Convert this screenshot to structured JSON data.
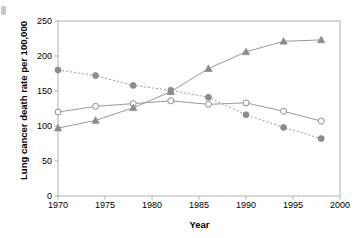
{
  "chart_data": {
    "type": "line",
    "title": "",
    "xlabel": "Year",
    "ylabel": "Lung cancer death rate per 100,000",
    "xlim": [
      1970,
      2000
    ],
    "ylim": [
      0,
      250
    ],
    "xticks": [
      1970,
      1975,
      1980,
      1985,
      1990,
      1995,
      2000
    ],
    "yticks": [
      0,
      50,
      100,
      150,
      200,
      250
    ],
    "grid": false,
    "legend": "none",
    "x": [
      1970,
      1974,
      1978,
      1982,
      1986,
      1990,
      1994,
      1998
    ],
    "series": [
      {
        "name": "series-filled-circle-dashed",
        "marker": "filled-circle",
        "line_style": "dashed",
        "color": "#8c8c8c",
        "values": [
          180,
          172,
          158,
          151,
          141,
          116,
          98,
          82
        ]
      },
      {
        "name": "series-open-circle-solid",
        "marker": "open-circle",
        "line_style": "solid",
        "color": "#8c8c8c",
        "values": [
          120,
          128,
          132,
          136,
          131,
          133,
          121,
          107
        ]
      },
      {
        "name": "series-filled-triangle-solid",
        "marker": "filled-triangle",
        "line_style": "solid",
        "color": "#8c8c8c",
        "values": [
          97,
          108,
          126,
          149,
          182,
          206,
          221,
          223
        ]
      }
    ]
  },
  "axes": {
    "y_title": "Lung cancer death rate per 100,000",
    "x_title": "Year",
    "y_tick_labels": [
      "250",
      "200",
      "150",
      "100",
      "50",
      "0"
    ],
    "x_tick_labels": [
      "1970",
      "1975",
      "1980",
      "1985",
      "1990",
      "1995",
      "2000"
    ]
  },
  "colors": {
    "frame": "#b0b0b0",
    "marker": "#8c8c8c",
    "line": "#9a9a9a",
    "text": "#000000",
    "background": "#ffffff"
  }
}
